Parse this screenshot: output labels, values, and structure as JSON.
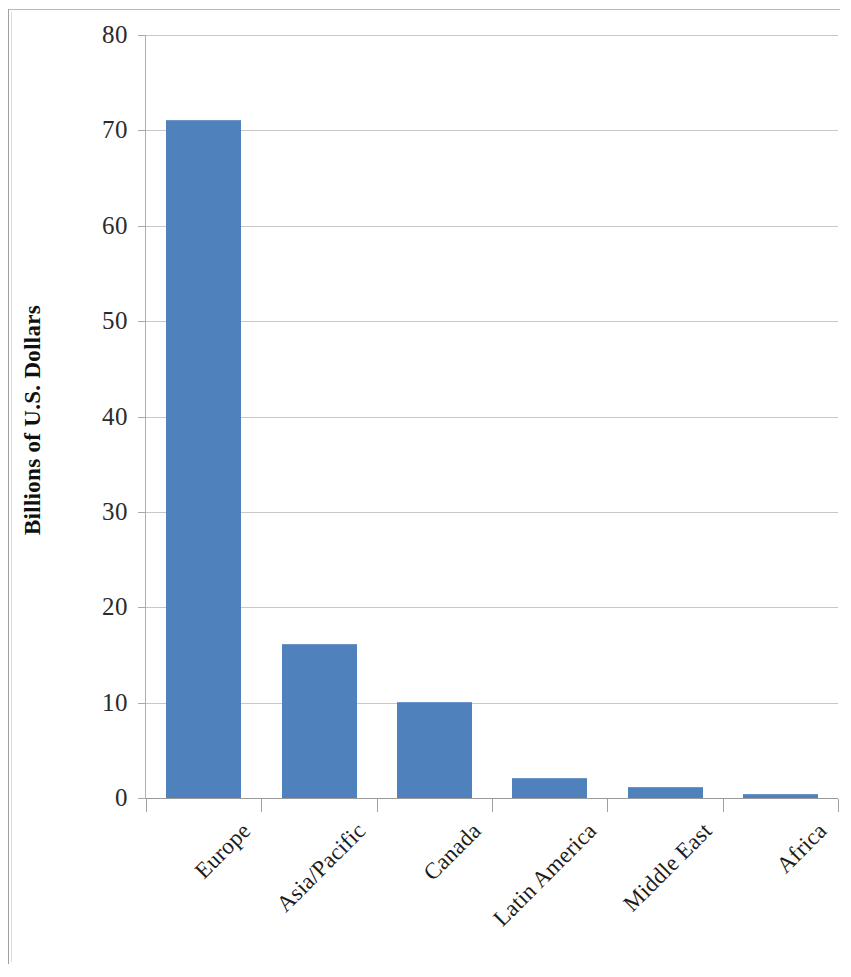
{
  "chart_data": {
    "type": "bar",
    "title": "",
    "xlabel": "",
    "ylabel": "Billions of U.S. Dollars",
    "categories": [
      "Europe",
      "Asia/Pacific",
      "Canada",
      "Latin America",
      "Middle East",
      "Africa"
    ],
    "values": [
      71,
      16,
      10,
      2,
      1,
      0.2
    ],
    "series": [
      {
        "name": "Billions of U.S. Dollars",
        "values": [
          71,
          16,
          10,
          2,
          1,
          0.2
        ]
      }
    ],
    "ylim": [
      0,
      80
    ],
    "y_ticks": [
      0,
      10,
      20,
      30,
      40,
      50,
      60,
      70,
      80
    ],
    "y_tick_labels": [
      "0",
      "10",
      "20",
      "30",
      "40",
      "50",
      "60",
      "70",
      "80"
    ],
    "grid": "horizontal",
    "legend": "none",
    "bar_color": "#4F81BD",
    "gridline_color": "#C8C8C8",
    "axis_color": "#9A9A9A",
    "background_color": "#FFFFFF",
    "x_tick_label_rotation": "-45"
  }
}
